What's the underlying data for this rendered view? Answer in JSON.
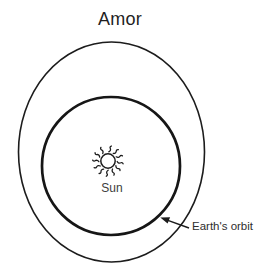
{
  "diagram": {
    "title": "Amor",
    "sun_label": "Sun",
    "earth_orbit_label": "Earth's orbit"
  },
  "icons": {
    "sun": "sun-icon"
  },
  "colors": {
    "background": "#ffffff",
    "line": "#1c1c1c",
    "title_text": "#1f1f1f",
    "label_text": "#3d3d3d"
  }
}
